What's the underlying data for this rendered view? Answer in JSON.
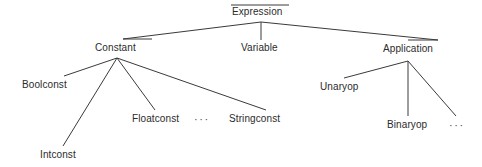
{
  "diagram": {
    "type": "tree",
    "colors": {
      "background": "#ffffff",
      "edge": "#3a3a3a",
      "text": "#2b2b2b"
    },
    "nodes": [
      {
        "id": "expression",
        "label": "Expression",
        "level": 0,
        "x": 232,
        "y": 6,
        "parent": null
      },
      {
        "id": "constant",
        "label": "Constant",
        "level": 1,
        "x": 95,
        "y": 42,
        "parent": "expression"
      },
      {
        "id": "variable",
        "label": "Variable",
        "level": 1,
        "x": 241,
        "y": 42,
        "parent": "expression"
      },
      {
        "id": "application",
        "label": "Application",
        "level": 1,
        "x": 383,
        "y": 43,
        "parent": "expression"
      },
      {
        "id": "boolconst",
        "label": "Boolconst",
        "level": 2,
        "x": 22,
        "y": 79,
        "parent": "constant"
      },
      {
        "id": "intconst",
        "label": "Intconst",
        "level": 2,
        "x": 40,
        "y": 149,
        "parent": "constant"
      },
      {
        "id": "floatconst",
        "label": "Floatconst",
        "level": 2,
        "x": 132,
        "y": 113,
        "parent": "constant"
      },
      {
        "id": "stringconst",
        "label": "Stringconst",
        "level": 2,
        "x": 229,
        "y": 113,
        "parent": "constant"
      },
      {
        "id": "unaryop",
        "label": "Unaryop",
        "level": 2,
        "x": 320,
        "y": 81,
        "parent": "application"
      },
      {
        "id": "binaryop",
        "label": "Binaryop",
        "level": 2,
        "x": 387,
        "y": 119,
        "parent": "application"
      }
    ],
    "ellipses": [
      {
        "id": "constant-ellipsis",
        "label": "···",
        "x": 194,
        "y": 113,
        "after": "floatconst"
      },
      {
        "id": "application-ellipsis",
        "label": "···",
        "x": 449,
        "y": 119,
        "after": "binaryop"
      }
    ],
    "edges": [
      {
        "from": "expression",
        "to": "constant",
        "x1": 261,
        "y1": 22,
        "x2": 120,
        "y2": 39
      },
      {
        "from": "expression",
        "to": "variable",
        "x1": 261,
        "y1": 22,
        "x2": 261,
        "y2": 40
      },
      {
        "from": "expression",
        "to": "application",
        "x1": 261,
        "y1": 22,
        "x2": 404,
        "y2": 40
      },
      {
        "from": "root-bar",
        "to": "expression",
        "x1": 231,
        "y1": 5,
        "x2": 289,
        "y2": 5
      },
      {
        "from": "constant-bar",
        "to": "constant",
        "x1": 123,
        "y1": 39,
        "x2": 152,
        "y2": 39
      },
      {
        "from": "app-bar",
        "to": "application",
        "x1": 408,
        "y1": 40,
        "x2": 438,
        "y2": 40
      },
      {
        "from": "constant",
        "to": "boolconst",
        "x1": 117,
        "y1": 58,
        "x2": 64,
        "y2": 76
      },
      {
        "from": "constant",
        "to": "intconst",
        "x1": 117,
        "y1": 58,
        "x2": 63,
        "y2": 146
      },
      {
        "from": "constant",
        "to": "floatconst",
        "x1": 117,
        "y1": 58,
        "x2": 155,
        "y2": 110
      },
      {
        "from": "constant",
        "to": "stringconst",
        "x1": 117,
        "y1": 58,
        "x2": 266,
        "y2": 110
      },
      {
        "from": "application",
        "to": "unaryop",
        "x1": 408,
        "y1": 61,
        "x2": 344,
        "y2": 78
      },
      {
        "from": "application",
        "to": "binaryop",
        "x1": 408,
        "y1": 61,
        "x2": 408,
        "y2": 116
      },
      {
        "from": "application",
        "to": "ellipsis",
        "x1": 408,
        "y1": 61,
        "x2": 456,
        "y2": 116
      }
    ]
  }
}
